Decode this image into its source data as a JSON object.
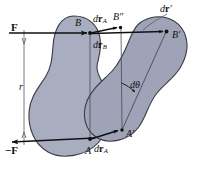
{
  "figure": {
    "background_color": "#ffffff",
    "blob_fill": "#a9adc0",
    "blob_fill_right": "#9ea3b7",
    "blob_stroke": "#3a3a44",
    "line_color": "#111111",
    "thin_line_color": "#55555f"
  },
  "labels": {
    "force_top": "F",
    "force_bottom": "−F",
    "distance": "r",
    "point_B": "B",
    "point_A": "A",
    "point_B_double_prime": "B″",
    "point_B_prime": "B′",
    "point_A_prime": "A′",
    "d_r_A_top": {
      "d": "d",
      "r": "r",
      "sub": "A"
    },
    "d_r_B": {
      "d": "d",
      "r": "r",
      "sub": "B"
    },
    "d_r_prime": {
      "d": "d",
      "r": "r",
      "prime": "′"
    },
    "d_r_A_bottom": {
      "d": "d",
      "r": "r",
      "sub": "A"
    },
    "d_theta": "dθ"
  },
  "geometry": {
    "force_top_arrow": {
      "x1": 24,
      "y1": 33,
      "x2": 90,
      "y2": 33
    },
    "force_bottom_arrow": {
      "x1": 40,
      "y1": 139,
      "x2": 12,
      "y2": 143
    },
    "distance_line": {
      "x1": 24,
      "y1": 36,
      "x2": 24,
      "y2": 140
    },
    "B_to_Bdd": {
      "x1": 90,
      "y1": 33,
      "x2": 120,
      "y2": 27
    },
    "B_to_Bprime": {
      "x1": 90,
      "y1": 33,
      "x2": 166,
      "y2": 31
    },
    "A_to_Aprime": {
      "x1": 90,
      "y1": 139,
      "x2": 122,
      "y2": 130
    },
    "vertical_B_A": {
      "x1": 90,
      "y1": 33,
      "x2": 90,
      "y2": 139
    },
    "vertical_Bdd_Aprime": {
      "x1": 121,
      "y1": 27,
      "x2": 122,
      "y2": 130
    },
    "diagonal_Bprime_Aprime": {
      "x1": 167,
      "y1": 31,
      "x2": 122,
      "y2": 130
    },
    "angle_marker": {
      "cx": 122,
      "cy": 130,
      "radius": 56
    }
  },
  "points": [
    {
      "name": "B",
      "x": 90,
      "y": 33
    },
    {
      "name": "A",
      "x": 90,
      "y": 139
    },
    {
      "name": "B″",
      "x": 120,
      "y": 27
    },
    {
      "name": "B′",
      "x": 167,
      "y": 31
    },
    {
      "name": "A′",
      "x": 122,
      "y": 130
    }
  ]
}
